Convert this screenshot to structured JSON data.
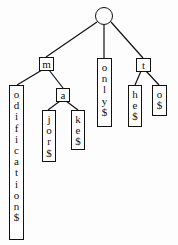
{
  "diagram": {
    "type": "suffix-trie",
    "root": {
      "id": "root",
      "shape": "circle"
    },
    "nodes": [
      {
        "id": "m",
        "label": "m",
        "kind": "label"
      },
      {
        "id": "odification",
        "label": "odification$",
        "kind": "leaf"
      },
      {
        "id": "a",
        "label": "a",
        "kind": "label"
      },
      {
        "id": "jor",
        "label": "jor$",
        "kind": "leaf"
      },
      {
        "id": "ke",
        "label": "ke$",
        "kind": "leaf"
      },
      {
        "id": "only",
        "label": "only$",
        "kind": "leaf"
      },
      {
        "id": "t",
        "label": "t",
        "kind": "label"
      },
      {
        "id": "he",
        "label": "he$",
        "kind": "leaf"
      },
      {
        "id": "o",
        "label": "o$",
        "kind": "leaf"
      }
    ],
    "edges": [
      [
        "root",
        "m"
      ],
      [
        "root",
        "only"
      ],
      [
        "root",
        "t"
      ],
      [
        "m",
        "odification"
      ],
      [
        "m",
        "a"
      ],
      [
        "a",
        "jor"
      ],
      [
        "a",
        "ke"
      ],
      [
        "t",
        "he"
      ],
      [
        "t",
        "o"
      ]
    ]
  }
}
